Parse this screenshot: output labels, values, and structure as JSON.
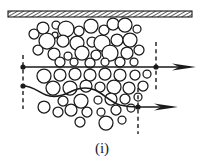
{
  "figure": {
    "caption": "(i)",
    "colors": {
      "stroke": "#1a1a1a",
      "background": "#ffffff",
      "particle_fill": "#ffffff",
      "wall_fill": "#e8e8e8"
    },
    "wall": {
      "label": "rigid-hatched-boundary",
      "x": 8,
      "y": 11,
      "width": 184,
      "height": 6,
      "hatch_angle_deg": 60,
      "hatch_spacing": 3
    },
    "streamlines": [
      {
        "name": "upper-streamline",
        "shape": "straight",
        "start": {
          "x": 23,
          "y": 67
        },
        "end": {
          "x": 156,
          "y": 67
        },
        "arrow": {
          "tip_x": 196,
          "tip_y": 67
        },
        "entry_marker": {
          "x": 23,
          "y": 67
        },
        "exit_marker": {
          "x": 156,
          "y": 67
        }
      },
      {
        "name": "lower-streamline",
        "shape": "curved",
        "start": {
          "x": 23,
          "y": 86
        },
        "end": {
          "x": 138,
          "y": 107
        },
        "arrow": {
          "tip_x": 178,
          "tip_y": 107
        },
        "entry_marker": {
          "x": 23,
          "y": 86
        },
        "exit_marker": {
          "x": 138,
          "y": 107
        },
        "path": "M23,86 C33,86 38,92 46,95 C54,98 62,96 70,92 C78,88 86,86 95,90 C104,94 110,102 120,105 C128,107 133,107 138,107"
      }
    ],
    "dashed_lines": [
      {
        "name": "inlet-reference-line",
        "x": 23,
        "y1": 55,
        "y2": 109
      },
      {
        "name": "upper-outlet-reference-line",
        "x": 156,
        "y1": 42,
        "y2": 91
      },
      {
        "name": "lower-outlet-reference-line",
        "x": 138,
        "y1": 88,
        "y2": 134
      }
    ],
    "particles": [
      {
        "cx": 43,
        "cy": 28,
        "r": 6
      },
      {
        "cx": 56,
        "cy": 25,
        "r": 4
      },
      {
        "cx": 66,
        "cy": 29,
        "r": 8
      },
      {
        "cx": 79,
        "cy": 31,
        "r": 5
      },
      {
        "cx": 91,
        "cy": 26,
        "r": 7
      },
      {
        "cx": 104,
        "cy": 30,
        "r": 5
      },
      {
        "cx": 113,
        "cy": 24,
        "r": 6
      },
      {
        "cx": 125,
        "cy": 25,
        "r": 7
      },
      {
        "cx": 137,
        "cy": 29,
        "r": 4
      },
      {
        "cx": 55,
        "cy": 35,
        "r": 3
      },
      {
        "cx": 47,
        "cy": 41,
        "r": 8
      },
      {
        "cx": 63,
        "cy": 41,
        "r": 6
      },
      {
        "cx": 77,
        "cy": 43,
        "r": 7
      },
      {
        "cx": 92,
        "cy": 42,
        "r": 5
      },
      {
        "cx": 102,
        "cy": 43,
        "r": 8
      },
      {
        "cx": 117,
        "cy": 40,
        "r": 6
      },
      {
        "cx": 130,
        "cy": 40,
        "r": 7
      },
      {
        "cx": 34,
        "cy": 34,
        "r": 5
      },
      {
        "cx": 38,
        "cy": 50,
        "r": 5
      },
      {
        "cx": 54,
        "cy": 54,
        "r": 6
      },
      {
        "cx": 68,
        "cy": 56,
        "r": 4
      },
      {
        "cx": 82,
        "cy": 53,
        "r": 7
      },
      {
        "cx": 96,
        "cy": 55,
        "r": 5
      },
      {
        "cx": 110,
        "cy": 53,
        "r": 8
      },
      {
        "cx": 127,
        "cy": 53,
        "r": 6
      },
      {
        "cx": 139,
        "cy": 50,
        "r": 5
      },
      {
        "cx": 60,
        "cy": 62,
        "r": 5
      },
      {
        "cx": 74,
        "cy": 62,
        "r": 4
      },
      {
        "cx": 90,
        "cy": 63,
        "r": 5
      },
      {
        "cx": 105,
        "cy": 62,
        "r": 4
      },
      {
        "cx": 120,
        "cy": 62,
        "r": 5
      },
      {
        "cx": 134,
        "cy": 62,
        "r": 4
      },
      {
        "cx": 44,
        "cy": 76,
        "r": 7
      },
      {
        "cx": 60,
        "cy": 75,
        "r": 6
      },
      {
        "cx": 75,
        "cy": 74,
        "r": 6
      },
      {
        "cx": 90,
        "cy": 75,
        "r": 6
      },
      {
        "cx": 105,
        "cy": 74,
        "r": 6
      },
      {
        "cx": 120,
        "cy": 75,
        "r": 6
      },
      {
        "cx": 135,
        "cy": 75,
        "r": 5
      },
      {
        "cx": 147,
        "cy": 74,
        "r": 4
      },
      {
        "cx": 53,
        "cy": 88,
        "r": 7
      },
      {
        "cx": 70,
        "cy": 88,
        "r": 7
      },
      {
        "cx": 86,
        "cy": 86,
        "r": 6
      },
      {
        "cx": 100,
        "cy": 87,
        "r": 5
      },
      {
        "cx": 114,
        "cy": 87,
        "r": 7
      },
      {
        "cx": 129,
        "cy": 88,
        "r": 6
      },
      {
        "cx": 143,
        "cy": 86,
        "r": 5
      },
      {
        "cx": 63,
        "cy": 101,
        "r": 5
      },
      {
        "cx": 81,
        "cy": 101,
        "r": 7
      },
      {
        "cx": 98,
        "cy": 100,
        "r": 4
      },
      {
        "cx": 111,
        "cy": 99,
        "r": 6
      },
      {
        "cx": 125,
        "cy": 99,
        "r": 5
      },
      {
        "cx": 138,
        "cy": 97,
        "r": 4
      },
      {
        "cx": 44,
        "cy": 107,
        "r": 6
      },
      {
        "cx": 58,
        "cy": 112,
        "r": 5
      },
      {
        "cx": 71,
        "cy": 110,
        "r": 6
      },
      {
        "cx": 87,
        "cy": 112,
        "r": 5
      },
      {
        "cx": 101,
        "cy": 112,
        "r": 4
      },
      {
        "cx": 116,
        "cy": 110,
        "r": 5
      },
      {
        "cx": 131,
        "cy": 108,
        "r": 4
      },
      {
        "cx": 80,
        "cy": 122,
        "r": 5
      },
      {
        "cx": 106,
        "cy": 123,
        "r": 7
      },
      {
        "cx": 122,
        "cy": 120,
        "r": 4
      }
    ]
  }
}
